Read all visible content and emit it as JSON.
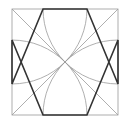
{
  "diagram": {
    "square": {
      "x": 12,
      "y": 9,
      "size": 106,
      "stroke": "#9a9a9a"
    },
    "octagon": {
      "stroke": "#333333",
      "stroke_width": 1.6
    },
    "arcs": {
      "stroke": "#9a9a9a",
      "count": 4
    },
    "diagonals": {
      "stroke": "#9a9a9a",
      "count": 2
    }
  }
}
